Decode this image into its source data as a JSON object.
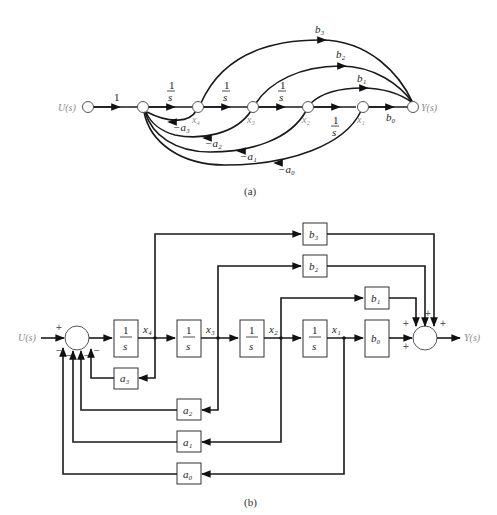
{
  "figure_a": {
    "caption": "(a)",
    "input_label": "U(s)",
    "output_label": "Y(s)",
    "forward_gains": [
      "1",
      "1/s",
      "1/s",
      "1/s",
      "1/s"
    ],
    "node_labels": [
      "x4",
      "x3",
      "x2",
      "x1"
    ],
    "output_gains": [
      "b3",
      "b2",
      "b1",
      "b0"
    ],
    "feedback_gains": [
      "-a3",
      "-a2",
      "-a1",
      "-a0"
    ],
    "integrator_num": "1",
    "integrator_den": "s",
    "unit_gain": "1",
    "b3": "b₃",
    "b2": "b₂",
    "b1": "b₁",
    "b0": "b₀",
    "na3": "−a₃",
    "na2": "−a₂",
    "na1": "−a₁",
    "na0": "−a₀",
    "x4": "x₄",
    "x3": "x₃",
    "x2": "x₂",
    "x1": "x₁"
  },
  "figure_b": {
    "caption": "(b)",
    "input_label": "U(s)",
    "output_label": "Y(s)",
    "integrator_num": "1",
    "integrator_den": "s",
    "state_labels": {
      "x4": "x₄",
      "x3": "x₃",
      "x2": "x₂",
      "x1": "x₁"
    },
    "output_blocks": {
      "b3": "b₃",
      "b2": "b₂",
      "b1": "b₁",
      "b0": "b₀"
    },
    "feedback_blocks": {
      "a3": "a₃",
      "a2": "a₂",
      "a1": "a₁",
      "a0": "a₀"
    },
    "input_sum_signs": {
      "plus": "+",
      "minus": "−"
    },
    "output_sum_signs": {
      "plus": "+"
    }
  }
}
